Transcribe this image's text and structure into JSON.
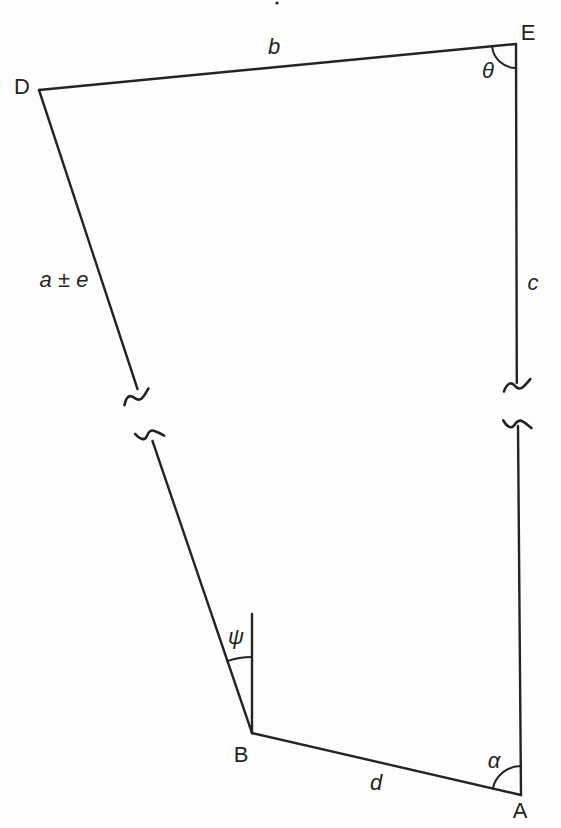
{
  "canvas": {
    "width": 561,
    "height": 828,
    "background": "#fdfdfd",
    "ink": "#242424"
  },
  "figure": {
    "description_labels_only": "geometric traverse figure",
    "vertices": [
      {
        "id": "D",
        "x": 39,
        "y": 90
      },
      {
        "id": "E",
        "x": 516,
        "y": 44
      },
      {
        "id": "B",
        "x": 252,
        "y": 733
      },
      {
        "id": "A",
        "x": 521,
        "y": 795
      }
    ],
    "segments": [
      {
        "name": "edge-b",
        "x1": 39,
        "y1": 90,
        "x2": 516,
        "y2": 44
      },
      {
        "name": "edge-DB-upper",
        "x1": 39,
        "y1": 90,
        "x2": 137.5,
        "y2": 389
      },
      {
        "name": "edge-DB-lower",
        "x1": 152.5,
        "y1": 441,
        "x2": 252,
        "y2": 733
      },
      {
        "name": "edge-EA-upper",
        "x1": 516,
        "y1": 44,
        "x2": 516.8,
        "y2": 383
      },
      {
        "name": "edge-EA-lower",
        "x1": 518,
        "y1": 426,
        "x2": 521,
        "y2": 795
      },
      {
        "name": "edge-d",
        "x1": 252,
        "y1": 733,
        "x2": 521,
        "y2": 795
      },
      {
        "name": "ref-line-vertical-B",
        "x1": 252,
        "y1": 614,
        "x2": 252,
        "y2": 733
      }
    ],
    "breaks": [
      {
        "name": "break-mark-DB-upper",
        "x": 137,
        "y": 398,
        "angle": -16,
        "flip": false
      },
      {
        "name": "break-mark-DB-lower",
        "x": 149.5,
        "y": 433.5,
        "angle": -16,
        "flip": true
      },
      {
        "name": "break-mark-EA-upper",
        "x": 517.5,
        "y": 386.5,
        "angle": -6,
        "flip": false
      },
      {
        "name": "break-mark-EA-lower",
        "x": 517.5,
        "y": 423,
        "angle": -4,
        "flip": true
      }
    ],
    "arcs": [
      {
        "name": "angle-arc-theta",
        "cx": 516,
        "cy": 44,
        "r": 24,
        "a1": 174.5,
        "a2": 89.8,
        "sweep": 0
      },
      {
        "name": "angle-arc-psi",
        "cx": 252,
        "cy": 733,
        "r": 76,
        "a1": 251,
        "a2": 270,
        "sweep": 1
      },
      {
        "name": "angle-arc-alpha",
        "cx": 521,
        "cy": 795,
        "r": 29,
        "a1": 193,
        "a2": 269.5,
        "sweep": 1
      }
    ],
    "labels": [
      {
        "name": "vertex-label-D",
        "text": "D",
        "x": 22,
        "y": 87,
        "style": "upright"
      },
      {
        "name": "vertex-label-E",
        "text": "E",
        "x": 528,
        "y": 33,
        "style": "upright"
      },
      {
        "name": "vertex-label-B",
        "text": "B",
        "x": 241,
        "y": 755,
        "style": "upright"
      },
      {
        "name": "vertex-label-A",
        "text": "A",
        "x": 520,
        "y": 811,
        "style": "upright"
      },
      {
        "name": "edge-label-b",
        "text": "b",
        "x": 274,
        "y": 47,
        "style": "italic"
      },
      {
        "name": "edge-label-a-pm-e",
        "text": "a ± e",
        "x": 64,
        "y": 280,
        "style": "italic"
      },
      {
        "name": "edge-label-c",
        "text": "c",
        "x": 533,
        "y": 283,
        "style": "italic"
      },
      {
        "name": "edge-label-d",
        "text": "d",
        "x": 376,
        "y": 783,
        "style": "italic"
      },
      {
        "name": "angle-label-theta",
        "text": "θ",
        "x": 488,
        "y": 71,
        "style": "italic"
      },
      {
        "name": "angle-label-psi",
        "text": "ψ",
        "x": 236,
        "y": 637,
        "style": "italic"
      },
      {
        "name": "angle-label-alpha",
        "text": "α",
        "x": 494,
        "y": 761,
        "style": "italic"
      }
    ],
    "artifacts": [
      {
        "name": "stray-dot",
        "x": 277,
        "y": 3,
        "r": 1.6
      }
    ]
  }
}
